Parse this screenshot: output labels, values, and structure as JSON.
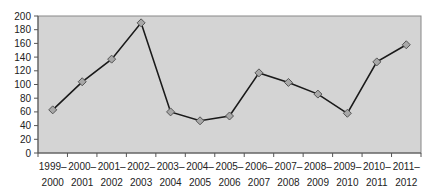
{
  "chart_data": {
    "type": "line",
    "title": "",
    "xlabel": "",
    "ylabel": "",
    "categories": [
      "1999–2000",
      "2000–2001",
      "2001–2002",
      "2002–2003",
      "2003–2004",
      "2004–2005",
      "2005–2006",
      "2006–2007",
      "2007–2008",
      "2008–2009",
      "2009–2010",
      "2010–2011",
      "2011–2012"
    ],
    "category_lines": [
      [
        "1999–",
        "2000"
      ],
      [
        "2000–",
        "2001"
      ],
      [
        "2001–",
        "2002"
      ],
      [
        "2002–",
        "2003"
      ],
      [
        "2003–",
        "2004"
      ],
      [
        "2004–",
        "2005"
      ],
      [
        "2005–",
        "2006"
      ],
      [
        "2006–",
        "2007"
      ],
      [
        "2007–",
        "2008"
      ],
      [
        "2008–",
        "2009"
      ],
      [
        "2009–",
        "2010"
      ],
      [
        "2010–",
        "2011"
      ],
      [
        "2011–",
        "2012"
      ]
    ],
    "series": [
      {
        "name": "Series 1",
        "values": [
          63,
          104,
          137,
          190,
          60,
          47,
          54,
          117,
          103,
          86,
          58,
          133,
          158
        ]
      }
    ],
    "ylim": [
      0,
      200
    ],
    "yticks": [
      0,
      20,
      40,
      60,
      80,
      100,
      120,
      140,
      160,
      180,
      200
    ],
    "grid": false,
    "legend": "none",
    "marker": "diamond"
  },
  "colors": {
    "plot_background": "#d4d4d4",
    "line": "#1a1a1a",
    "marker_fill": "#a8a8a8",
    "marker_stroke": "#555555",
    "axis": "#555555"
  }
}
